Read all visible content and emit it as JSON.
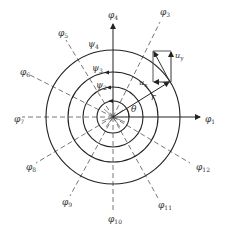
{
  "diagram": {
    "center": {
      "x": 113,
      "y": 117
    },
    "circles": [
      {
        "name": "circle-psi-1",
        "r": 16
      },
      {
        "name": "circle-psi-2",
        "r": 30
      },
      {
        "name": "circle-psi-3",
        "r": 45
      },
      {
        "name": "circle-psi-4",
        "r": 67
      }
    ],
    "circle_labels": [
      {
        "base": "ψ",
        "sub": "4",
        "x": 88,
        "y": 47
      },
      {
        "base": "ψ",
        "sub": "3",
        "x": 92,
        "y": 71
      },
      {
        "base": "ψ",
        "sub": "2",
        "x": 96,
        "y": 88
      }
    ],
    "angle_lines": [
      {
        "base": "φ",
        "sub": "1",
        "x": 205,
        "y": 122
      },
      {
        "base": "φ",
        "sub": "3",
        "x": 160,
        "y": 15
      },
      {
        "base": "φ",
        "sub": "4",
        "x": 108,
        "y": 18
      },
      {
        "base": "φ",
        "sub": "5",
        "x": 58,
        "y": 36
      },
      {
        "base": "φ",
        "sub": "6",
        "x": 20,
        "y": 75
      },
      {
        "base": "φ",
        "sub": "7",
        "x": 14,
        "y": 122
      },
      {
        "base": "φ",
        "sub": "8",
        "x": 26,
        "y": 170
      },
      {
        "base": "φ",
        "sub": "9",
        "x": 62,
        "y": 205
      },
      {
        "base": "φ",
        "sub": "10",
        "x": 108,
        "y": 222
      },
      {
        "base": "φ",
        "sub": "11",
        "x": 158,
        "y": 208
      },
      {
        "base": "φ",
        "sub": "12",
        "x": 196,
        "y": 170
      }
    ],
    "vector_labels": {
      "r": "r",
      "theta": "θ",
      "ux": {
        "base": "u",
        "sub": "x"
      },
      "uy": {
        "base": "u",
        "sub": "y"
      }
    },
    "colors": {
      "line": "#222222",
      "dash": "#555555",
      "vector": "#333333"
    }
  }
}
